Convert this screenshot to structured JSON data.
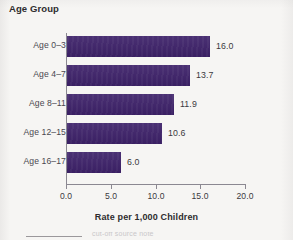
{
  "figure": {
    "background_color": "#f6f5f3",
    "bar_color": "#3d2169",
    "axis_color": "#8b8891",
    "text_color": "#3b3940"
  },
  "chart_data": {
    "type": "bar",
    "orientation": "horizontal",
    "title": "Age Group",
    "xlabel": "Rate per 1,000 Children",
    "ylabel": "Age Group",
    "categories": [
      "Age 0–3",
      "Age 4–7",
      "Age 8–11",
      "Age 12–15",
      "Age 16–17"
    ],
    "values": [
      16.0,
      13.7,
      11.9,
      10.6,
      6.0
    ],
    "value_labels": [
      "16.0",
      "13.7",
      "11.9",
      "10.6",
      "6.0"
    ],
    "xlim": [
      0.0,
      20.0
    ],
    "xticks": [
      0.0,
      5.0,
      10.0,
      15.0,
      20.0
    ],
    "xtick_labels": [
      "0.0",
      "5.0",
      "10.0",
      "15.0",
      "20.0"
    ],
    "grid": false,
    "legend": false,
    "series": [
      {
        "name": "Rate per 1,000 Children",
        "color": "#3d2169",
        "values": [
          16.0,
          13.7,
          11.9,
          10.6,
          6.0
        ]
      }
    ]
  },
  "footer": {
    "cutoff_text": "cut-off source note"
  }
}
